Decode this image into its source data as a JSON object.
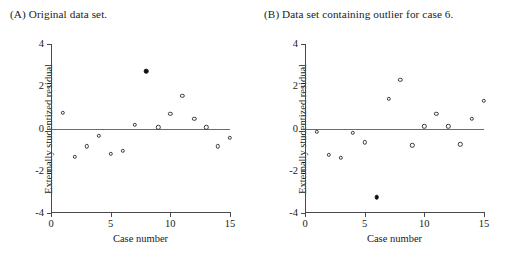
{
  "figure": {
    "panels": [
      {
        "key": "a",
        "title": "(A) Original data set.",
        "title_name": "panel-a-title"
      },
      {
        "key": "b",
        "title": "(B) Data set containing outlier for case 6.",
        "title_name": "panel-b-title"
      }
    ]
  },
  "axes": {
    "xlabel": "Case number",
    "ylabel": "Externally studentized residual",
    "xticks": [
      "0",
      "5",
      "10",
      "15"
    ],
    "yticks": [
      "4",
      "2",
      "0",
      "-2",
      "-4"
    ]
  },
  "chart_data": [
    {
      "type": "scatter",
      "title": "(A) Original data set.",
      "xlabel": "Case number",
      "ylabel": "Externally studentized residual",
      "xlim": [
        0,
        15
      ],
      "ylim": [
        -4,
        4
      ],
      "xticks": [
        0,
        5,
        10,
        15
      ],
      "yticks": [
        -4,
        -2,
        0,
        2,
        4
      ],
      "grid": false,
      "legend": "none",
      "zero_reference_line": 0,
      "series": [
        {
          "name": "Externally studentized residual",
          "marker": "open-circle",
          "x": [
            1,
            2,
            3,
            4,
            5,
            6,
            7,
            9,
            10,
            11,
            12,
            13,
            14,
            15
          ],
          "y": [
            0.75,
            -1.35,
            -0.85,
            -0.35,
            -1.2,
            -1.05,
            0.17,
            0.05,
            0.7,
            1.55,
            0.45,
            0.05,
            -0.85,
            -0.45
          ]
        },
        {
          "name": "Highlighted case 8",
          "marker": "filled-circle",
          "x": [
            8
          ],
          "y": [
            2.7
          ]
        }
      ]
    },
    {
      "type": "scatter",
      "title": "(B) Data set containing outlier for case 6.",
      "xlabel": "Case number",
      "ylabel": "Externally studentized residual",
      "xlim": [
        0,
        15
      ],
      "ylim": [
        -4,
        4
      ],
      "xticks": [
        0,
        5,
        10,
        15
      ],
      "yticks": [
        -4,
        -2,
        0,
        2,
        4
      ],
      "grid": false,
      "legend": "none",
      "zero_reference_line": 0,
      "series": [
        {
          "name": "Externally studentized residual",
          "marker": "open-circle",
          "x": [
            1,
            2,
            3,
            4,
            5,
            7,
            8,
            9,
            10,
            11,
            12,
            13,
            14,
            15
          ],
          "y": [
            -0.15,
            -1.25,
            -1.4,
            -0.2,
            -0.65,
            1.4,
            2.3,
            -0.8,
            0.1,
            0.7,
            0.1,
            -0.75,
            0.45,
            1.3
          ]
        },
        {
          "name": "Outlier case 6",
          "marker": "filled-circle",
          "x": [
            6
          ],
          "y": [
            -3.25
          ]
        }
      ]
    }
  ]
}
